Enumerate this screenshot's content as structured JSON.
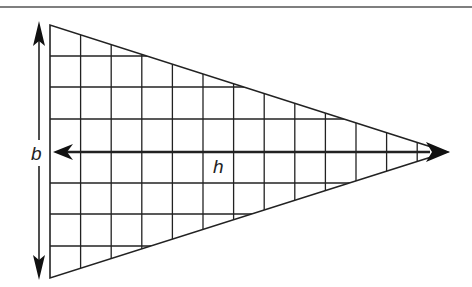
{
  "diagram": {
    "labels": {
      "base": "b",
      "height": "h"
    },
    "colors": {
      "stroke": "#222222",
      "background": "#ffffff"
    },
    "geometry": {
      "vertex_top": [
        50,
        25
      ],
      "vertex_bottom": [
        50,
        278
      ],
      "vertex_tip": [
        447,
        152
      ],
      "grid_spacing": 30.6,
      "grid_columns": 13,
      "grid_rows": 8
    },
    "arrows": [
      {
        "name": "base-arrow",
        "label": "b",
        "direction": "vertical-double"
      },
      {
        "name": "height-arrow",
        "label": "h",
        "direction": "horizontal-double"
      }
    ]
  }
}
